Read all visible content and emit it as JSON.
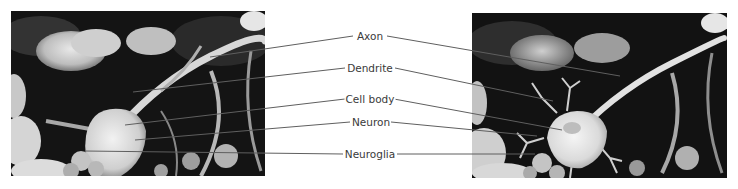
{
  "figure": {
    "labels": [
      {
        "id": "axon",
        "text": "Axon",
        "x": 370,
        "y": 36
      },
      {
        "id": "dendrite",
        "text": "Dendrite",
        "x": 370,
        "y": 68
      },
      {
        "id": "cell-body",
        "text": "Cell body",
        "x": 370,
        "y": 99
      },
      {
        "id": "neuron",
        "text": "Neuron",
        "x": 371,
        "y": 122
      },
      {
        "id": "neuroglia",
        "text": "Neuroglia",
        "x": 370,
        "y": 154
      }
    ],
    "colors": {
      "leader_line": "#5a5a5a",
      "label_text": "#3a3a3a",
      "background": "#ffffff"
    }
  }
}
